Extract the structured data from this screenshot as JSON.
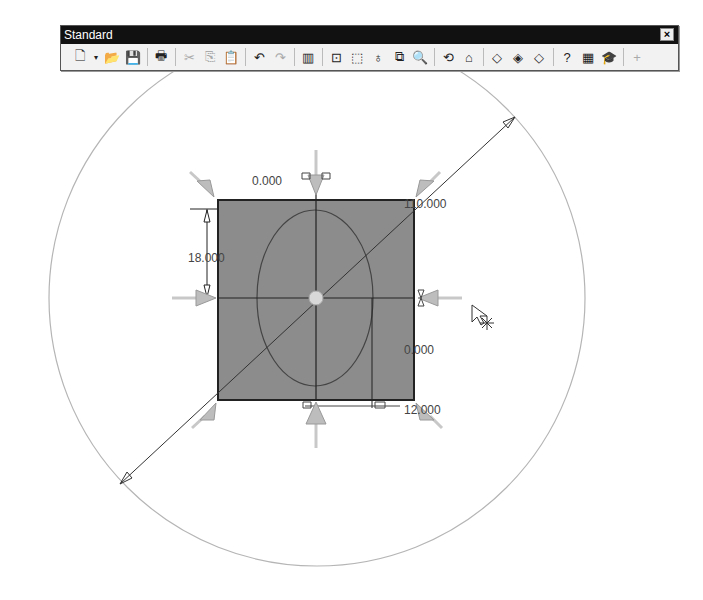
{
  "toolbar": {
    "title": "Standard",
    "close_label": "×",
    "buttons": [
      {
        "name": "new-document",
        "glyph": "🗋"
      },
      {
        "name": "dropdown-arrow",
        "glyph": "▾"
      },
      {
        "name": "open-folder",
        "glyph": "📂"
      },
      {
        "name": "save",
        "glyph": "💾"
      },
      {
        "name": "print",
        "glyph": "🖶"
      },
      {
        "name": "cut",
        "glyph": "✂"
      },
      {
        "name": "copy",
        "glyph": "⎘"
      },
      {
        "name": "paste",
        "glyph": "📋"
      },
      {
        "name": "undo",
        "glyph": "↶"
      },
      {
        "name": "redo",
        "glyph": "↷"
      },
      {
        "name": "rebuild",
        "glyph": "▥"
      },
      {
        "name": "zoom-to-fit",
        "glyph": "⊡"
      },
      {
        "name": "zoom-to-area",
        "glyph": "⬚"
      },
      {
        "name": "zoom-in-out",
        "glyph": "♁"
      },
      {
        "name": "zoom-to-selection",
        "glyph": "⧉"
      },
      {
        "name": "zoom",
        "glyph": "🔍"
      },
      {
        "name": "rotate-view",
        "glyph": "⟲"
      },
      {
        "name": "pan",
        "glyph": "⌂"
      },
      {
        "name": "view-cube-1",
        "glyph": "◇"
      },
      {
        "name": "view-cube-2",
        "glyph": "◈"
      },
      {
        "name": "view-cube-3",
        "glyph": "◇"
      },
      {
        "name": "help",
        "glyph": "?"
      },
      {
        "name": "calculator",
        "glyph": "▦"
      },
      {
        "name": "tutorial",
        "glyph": "🎓"
      },
      {
        "name": "add",
        "glyph": "+"
      }
    ]
  },
  "sketch": {
    "dim_top_left": "0.000",
    "dim_top_right": "110.000",
    "dim_left": "18.000",
    "dim_right": "0.000",
    "dim_bottom_right": "12.000"
  },
  "colors": {
    "rect_fill": "#8c8c8c",
    "circle": "#b5b5b5",
    "handle": "#bdbdbd"
  }
}
